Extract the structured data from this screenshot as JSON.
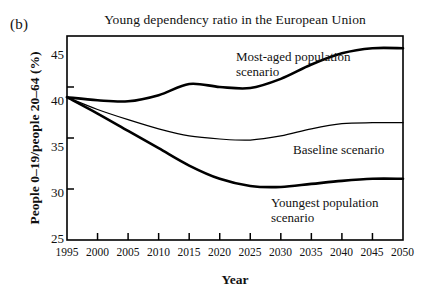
{
  "panel": {
    "label": "(b)"
  },
  "chart_data": {
    "type": "line",
    "title": "Young dependency ratio in the European Union",
    "xlabel": "Year",
    "ylabel": "People 0–19/people 20–64 (%)",
    "xlim": [
      1995,
      2050
    ],
    "ylim": [
      25,
      45
    ],
    "grid": false,
    "legend_position": "inline-annotations",
    "xticks": [
      1995,
      2000,
      2005,
      2010,
      2015,
      2020,
      2025,
      2030,
      2035,
      2040,
      2045,
      2050
    ],
    "xtick_labels": [
      "1995",
      "2000",
      "2005",
      "2010",
      "2015",
      "2020",
      "2025",
      "2030",
      "2035",
      "2040",
      "2045",
      "2050"
    ],
    "yticks": [
      25,
      30,
      35,
      40,
      45
    ],
    "ytick_labels": [
      "25",
      "30",
      "35",
      "40",
      "45"
    ],
    "x": [
      1995,
      2000,
      2005,
      2010,
      2015,
      2020,
      2025,
      2030,
      2035,
      2040,
      2045,
      2050
    ],
    "series": [
      {
        "name": "Most-aged population scenario",
        "label": "Most-aged population\nscenario",
        "color": "#000000",
        "width": 2.6,
        "values": [
          39.0,
          38.7,
          38.6,
          39.2,
          40.3,
          40.0,
          39.9,
          40.8,
          42.2,
          43.3,
          43.8,
          43.8
        ]
      },
      {
        "name": "Baseline scenario",
        "label": "Baseline scenario",
        "color": "#000000",
        "width": 1.2,
        "values": [
          39.0,
          37.8,
          36.8,
          35.9,
          35.2,
          34.9,
          34.8,
          35.2,
          35.9,
          36.4,
          36.5,
          36.5
        ]
      },
      {
        "name": "Youngest population scenario",
        "label": "Youngest population\nscenario",
        "color": "#000000",
        "width": 2.6,
        "values": [
          39.0,
          37.4,
          35.7,
          34.0,
          32.3,
          31.0,
          30.3,
          30.2,
          30.5,
          30.8,
          31.0,
          31.0
        ]
      }
    ]
  }
}
